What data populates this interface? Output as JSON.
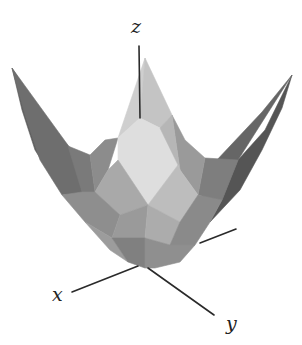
{
  "diagram": {
    "title": "",
    "labels": {
      "x": "x",
      "y": "y",
      "z": "z"
    },
    "label_positions": {
      "x": [
        52,
        301
      ],
      "y": [
        226,
        330
      ],
      "z": [
        131,
        33
      ]
    },
    "axes": [
      {
        "name": "z-axis",
        "from": [
          139,
          46
        ],
        "to": [
          140,
          118
        ]
      },
      {
        "name": "x-axis",
        "from": [
          72,
          292
        ],
        "to": [
          138,
          266
        ]
      },
      {
        "name": "y-axis",
        "from": [
          148,
          268
        ],
        "to": [
          214,
          315
        ]
      },
      {
        "name": "back-axis",
        "from": [
          200,
          243
        ],
        "to": [
          236,
          229
        ]
      }
    ],
    "facets": [
      {
        "name": "left-wing-outer",
        "fill": "#5e5e5e",
        "points": [
          [
            12,
            68
          ],
          [
            45,
            120
          ],
          [
            70,
            148
          ],
          [
            82,
            192
          ],
          [
            95,
            215
          ],
          [
            60,
            190
          ],
          [
            35,
            150
          ],
          [
            22,
            110
          ]
        ]
      },
      {
        "name": "left-wing-inner",
        "fill": "#6e6e6e",
        "points": [
          [
            12,
            68
          ],
          [
            70,
            148
          ],
          [
            82,
            192
          ],
          [
            62,
            195
          ],
          [
            40,
            160
          ],
          [
            25,
            115
          ]
        ]
      },
      {
        "name": "left-upper-step",
        "fill": "#7a7a7a",
        "points": [
          [
            68,
            146
          ],
          [
            90,
            155
          ],
          [
            95,
            192
          ],
          [
            82,
            192
          ]
        ]
      },
      {
        "name": "left-upper-mid",
        "fill": "#8c8c8c",
        "points": [
          [
            90,
            155
          ],
          [
            105,
            140
          ],
          [
            118,
            138
          ],
          [
            108,
            170
          ],
          [
            95,
            192
          ]
        ]
      },
      {
        "name": "right-wing-outer",
        "fill": "#555555",
        "points": [
          [
            292,
            75
          ],
          [
            265,
            130
          ],
          [
            238,
            160
          ],
          [
            222,
            200
          ],
          [
            210,
            222
          ],
          [
            240,
            190
          ],
          [
            262,
            150
          ],
          [
            282,
            108
          ]
        ]
      },
      {
        "name": "right-wing-inner",
        "fill": "#666666",
        "points": [
          [
            292,
            75
          ],
          [
            238,
            160
          ],
          [
            222,
            200
          ],
          [
            200,
            200
          ],
          [
            215,
            162
          ],
          [
            262,
            112
          ]
        ]
      },
      {
        "name": "right-upper-step",
        "fill": "#7e7e7e",
        "points": [
          [
            205,
            158
          ],
          [
            238,
            160
          ],
          [
            222,
            200
          ],
          [
            198,
            195
          ]
        ]
      },
      {
        "name": "right-upper-mid",
        "fill": "#9a9a9a",
        "points": [
          [
            172,
            115
          ],
          [
            185,
            140
          ],
          [
            205,
            158
          ],
          [
            198,
            195
          ],
          [
            180,
            170
          ]
        ]
      },
      {
        "name": "back-peak-left",
        "fill": "#cfcfcf",
        "points": [
          [
            145,
            58
          ],
          [
            118,
            138
          ],
          [
            140,
            118
          ]
        ]
      },
      {
        "name": "back-peak-right",
        "fill": "#c4c4c4",
        "points": [
          [
            145,
            58
          ],
          [
            172,
            115
          ],
          [
            160,
            128
          ],
          [
            140,
            118
          ]
        ]
      },
      {
        "name": "center-top-diamond",
        "fill": "#dedede",
        "points": [
          [
            140,
            118
          ],
          [
            160,
            128
          ],
          [
            178,
            165
          ],
          [
            148,
            205
          ],
          [
            118,
            160
          ],
          [
            118,
            138
          ]
        ]
      },
      {
        "name": "center-right-upper",
        "fill": "#b6b6b6",
        "points": [
          [
            160,
            128
          ],
          [
            172,
            115
          ],
          [
            180,
            170
          ],
          [
            178,
            165
          ]
        ]
      },
      {
        "name": "center-left-mid",
        "fill": "#a9a9a9",
        "points": [
          [
            108,
            170
          ],
          [
            118,
            160
          ],
          [
            148,
            205
          ],
          [
            120,
            215
          ],
          [
            95,
            192
          ]
        ]
      },
      {
        "name": "center-right-mid",
        "fill": "#bdbdbd",
        "points": [
          [
            178,
            165
          ],
          [
            180,
            170
          ],
          [
            198,
            195
          ],
          [
            180,
            222
          ],
          [
            148,
            205
          ]
        ]
      },
      {
        "name": "left-low-band",
        "fill": "#8e8e8e",
        "points": [
          [
            62,
            195
          ],
          [
            82,
            192
          ],
          [
            95,
            192
          ],
          [
            120,
            215
          ],
          [
            112,
            238
          ],
          [
            85,
            222
          ]
        ]
      },
      {
        "name": "left-lower",
        "fill": "#9c9c9c",
        "points": [
          [
            85,
            222
          ],
          [
            112,
            238
          ],
          [
            128,
            262
          ],
          [
            110,
            250
          ]
        ]
      },
      {
        "name": "center-low-left",
        "fill": "#9a9a9a",
        "points": [
          [
            120,
            215
          ],
          [
            148,
            205
          ],
          [
            145,
            238
          ],
          [
            112,
            238
          ]
        ]
      },
      {
        "name": "center-low-right",
        "fill": "#acacac",
        "points": [
          [
            148,
            205
          ],
          [
            180,
            222
          ],
          [
            170,
            245
          ],
          [
            145,
            238
          ]
        ]
      },
      {
        "name": "right-low-band",
        "fill": "#8a8a8a",
        "points": [
          [
            198,
            195
          ],
          [
            222,
            200
          ],
          [
            210,
            222
          ],
          [
            195,
            245
          ],
          [
            170,
            245
          ],
          [
            180,
            222
          ]
        ]
      },
      {
        "name": "bottom-left",
        "fill": "#808080",
        "points": [
          [
            112,
            238
          ],
          [
            145,
            238
          ],
          [
            145,
            268
          ],
          [
            128,
            262
          ]
        ]
      },
      {
        "name": "bottom-right",
        "fill": "#8f8f8f",
        "points": [
          [
            145,
            238
          ],
          [
            170,
            245
          ],
          [
            195,
            245
          ],
          [
            180,
            262
          ],
          [
            155,
            268
          ],
          [
            145,
            268
          ]
        ]
      }
    ]
  }
}
